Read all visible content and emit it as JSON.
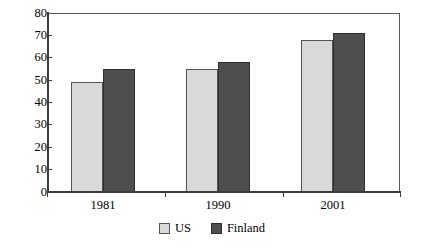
{
  "chart_data": {
    "type": "bar",
    "title": "",
    "subtitle": "",
    "xlabel": "",
    "ylabel": "",
    "categories": [
      "1981",
      "1990",
      "2001"
    ],
    "series": [
      {
        "name": "US",
        "color": "#d9d9d9",
        "values": [
          49,
          55,
          68
        ]
      },
      {
        "name": "Finland",
        "color": "#4f4f4f",
        "values": [
          55,
          58,
          71
        ]
      }
    ],
    "ylim": [
      0,
      80
    ],
    "ytick_step": 10,
    "yticks": [
      0,
      10,
      20,
      30,
      40,
      50,
      60,
      70,
      80
    ],
    "ytick_labels": [
      "0",
      "10",
      "20",
      "30",
      "40",
      "50",
      "60",
      "70",
      "80"
    ],
    "grid": false,
    "legend_position": "bottom-center",
    "legend_entries": [
      "US",
      "Finland"
    ],
    "annotations": []
  },
  "axes": {
    "y_labels": [
      "80",
      "70",
      "60",
      "50",
      "40",
      "30",
      "20",
      "10",
      "0"
    ],
    "x_labels": [
      "1981",
      "1990",
      "2001"
    ]
  },
  "legend": {
    "items": [
      {
        "label": "US",
        "swatch": "light-gray-swatch"
      },
      {
        "label": "Finland",
        "swatch": "dark-gray-swatch"
      }
    ]
  },
  "colors": {
    "us_bar": "#d9d9d9",
    "finland_bar": "#4f4f4f",
    "axis": "#3c3c3c",
    "frame": "#5a5a5a",
    "background": "#ffffff"
  }
}
